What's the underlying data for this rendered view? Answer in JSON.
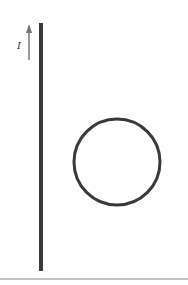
{
  "diagram": {
    "type": "physics-figure",
    "current_label": "I",
    "wire": {
      "x": 41,
      "y_top": 23,
      "y_bottom": 271,
      "width": 4,
      "color": "#3a3a3a"
    },
    "arrow": {
      "x": 29,
      "y_top": 24,
      "y_bottom": 60,
      "color": "#777777"
    },
    "loop": {
      "cx": 117,
      "cy": 162,
      "r": 43,
      "stroke_width": 3,
      "color": "#3a3a3a"
    },
    "baseline": {
      "y": 279,
      "x1": 0,
      "x2": 188,
      "color": "#888888"
    }
  }
}
